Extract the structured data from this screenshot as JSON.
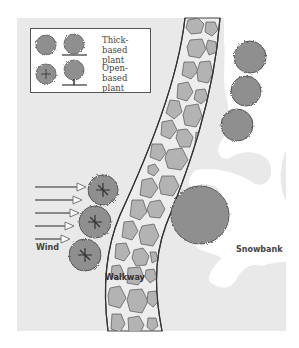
{
  "diagram": {
    "colors": {
      "panel": "#e9e9e9",
      "snow": "#ffffff",
      "plant_fill": "#8f8f8f",
      "plant_edge": "#555555",
      "stone_fill": "#b3b3b3",
      "walkway_fill": "#ededed",
      "arrow": "#777777"
    },
    "legend": {
      "items": [
        {
          "label": "Thick-based\nplant",
          "icon": "thick-based-plant-icon"
        },
        {
          "label": "Open-based\nplant",
          "icon": "open-based-plant-icon"
        }
      ]
    },
    "labels": {
      "wind": "Wind",
      "walkway": "Walkway",
      "snowbank": "Snowbank"
    },
    "wind_arrows": 5
  }
}
